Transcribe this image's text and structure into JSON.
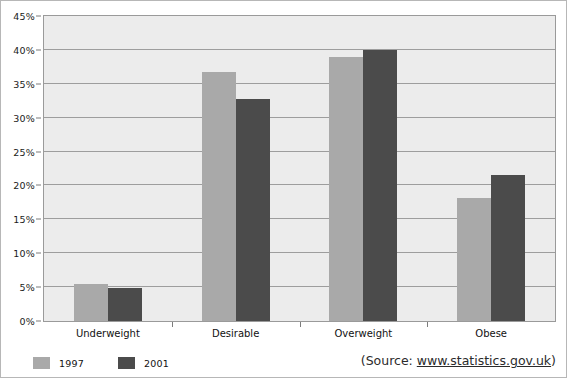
{
  "chart_data": {
    "type": "bar",
    "title": "",
    "xlabel": "",
    "ylabel": "",
    "categories": [
      "Underweight",
      "Desirable",
      "Overweight",
      "Obese"
    ],
    "series": [
      {
        "name": "1997",
        "color": "#a9a9a9",
        "values": [
          5.4,
          36.8,
          39.0,
          18.1
        ]
      },
      {
        "name": "2001",
        "color": "#4b4b4b",
        "values": [
          4.9,
          32.8,
          40.0,
          21.5
        ]
      }
    ],
    "ylim": [
      0,
      45
    ],
    "ytick_step": 5,
    "ytick_labels": [
      "0%",
      "5%",
      "10%",
      "15%",
      "20%",
      "25%",
      "30%",
      "35%",
      "40%",
      "45%"
    ],
    "ytick_values": [
      0,
      5,
      10,
      15,
      20,
      25,
      30,
      35,
      40,
      45
    ],
    "grid": true,
    "legend_position": "bottom-left",
    "plot_background": "#ececec",
    "gridline_color": "#9d9d9d"
  },
  "legend": {
    "entries": [
      {
        "label": "1997",
        "color": "#a9a9a9"
      },
      {
        "label": "2001",
        "color": "#4b4b4b"
      }
    ]
  },
  "source": {
    "prefix": "(Source: ",
    "url": "www.statistics.gov.uk",
    "suffix": ")"
  }
}
